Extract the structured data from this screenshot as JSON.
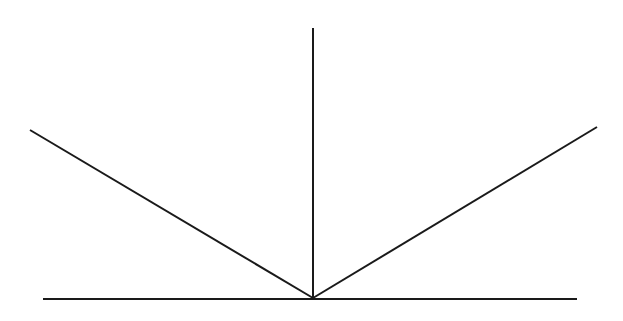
{
  "diagram": {
    "background": "#ffffff",
    "stroke_color": "#1a1a1a",
    "stroke_width": 2,
    "vertex": {
      "x": 313,
      "y": 298
    },
    "lines": [
      {
        "name": "surface-line",
        "x1": 43,
        "y1": 299,
        "x2": 577,
        "y2": 299
      },
      {
        "name": "normal-line",
        "x1": 313,
        "y1": 28,
        "x2": 313,
        "y2": 298
      },
      {
        "name": "incident-ray-left",
        "x1": 30,
        "y1": 130,
        "x2": 313,
        "y2": 298
      },
      {
        "name": "reflected-ray-right",
        "x1": 597,
        "y1": 127,
        "x2": 313,
        "y2": 298
      }
    ]
  }
}
